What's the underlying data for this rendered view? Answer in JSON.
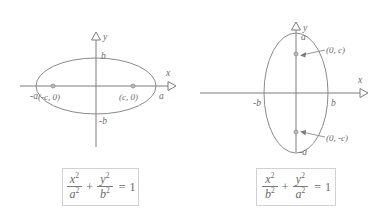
{
  "figure": {
    "panels": [
      {
        "id": "horizontal-ellipse",
        "orientation": "horizontal-major-axis",
        "axes": {
          "x_label": "x",
          "y_label": "y"
        },
        "tick_labels": {
          "x_negative": "-a",
          "x_positive": "a",
          "y_positive": "b",
          "y_negative": "-b"
        },
        "foci": [
          {
            "label": "(-c, 0)",
            "cx": 53,
            "cy": 86
          },
          {
            "label": "(c, 0)",
            "cx": 133,
            "cy": 86
          }
        ],
        "equation": {
          "num1": "x",
          "num1_exp": "2",
          "den1": "a",
          "den1_exp": "2",
          "operator": "+",
          "num2": "y",
          "num2_exp": "2",
          "den2": "b",
          "den2_exp": "2",
          "equals": "=",
          "rhs": "1"
        }
      },
      {
        "id": "vertical-ellipse",
        "orientation": "vertical-major-axis",
        "axes": {
          "x_label": "x",
          "y_label": "y"
        },
        "tick_labels": {
          "x_negative": "-b",
          "x_positive": "b",
          "y_positive": "a",
          "y_negative": "-a"
        },
        "foci": [
          {
            "label": "(0, c)",
            "cx": 104,
            "cy": 54
          },
          {
            "label": "(0, -c)",
            "cx": 104,
            "cy": 132
          }
        ],
        "equation": {
          "num1": "x",
          "num1_exp": "2",
          "den1": "b",
          "den1_exp": "2",
          "operator": "+",
          "num2": "y",
          "num2_exp": "2",
          "den2": "a",
          "den2_exp": "2",
          "equals": "=",
          "rhs": "1"
        }
      }
    ]
  },
  "colors": {
    "axis": "#7d7d7d",
    "curve": "#8a8a8a",
    "text": "#6a6a6a",
    "box_border": "#d2d2d2",
    "background": "#ffffff"
  }
}
